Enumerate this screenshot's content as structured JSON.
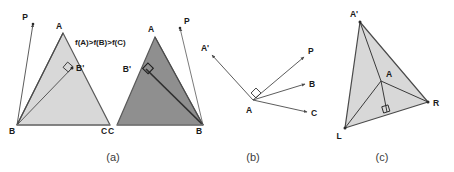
{
  "figure": {
    "width": 454,
    "height": 172,
    "background": "#ffffff",
    "stroke_color": "#4a4a4a",
    "label_color": "#1a1a1a",
    "caption_color": "#3b3b3b",
    "fill_light": "#d8d8d8",
    "fill_dark": "#8f8f8f"
  },
  "captions": [
    {
      "key": "a",
      "label": "(a)",
      "x": 113,
      "y": 160
    },
    {
      "key": "b",
      "label": "(b)",
      "x": 253,
      "y": 160
    },
    {
      "key": "c",
      "label": "(c)",
      "x": 382,
      "y": 160
    }
  ],
  "panel_a": {
    "annotation": "f(A)>f(B)>f(C)",
    "annotation_pos": {
      "x": 75,
      "y": 45
    },
    "triangle_light": {
      "fill": "#d8d8d8",
      "vertices": [
        {
          "name": "A",
          "x": 63,
          "y": 33,
          "label": "A",
          "label_x": 59,
          "label_y": 29
        },
        {
          "name": "B",
          "x": 17,
          "y": 125,
          "label": "B",
          "label_x": 12,
          "label_y": 134
        },
        {
          "name": "C",
          "x": 110,
          "y": 125,
          "label": "C",
          "label_x": 104,
          "label_y": 134
        }
      ],
      "point_P": {
        "name": "P",
        "x": 33,
        "y": 24,
        "label": "P",
        "label_x": 25,
        "label_y": 20
      },
      "point_Bprime": {
        "name": "B'",
        "x": 72,
        "y": 68,
        "label": "B'",
        "label_x": 76,
        "label_y": 70
      },
      "right_angle_marker": {
        "x": 68,
        "y": 67
      }
    },
    "triangle_dark": {
      "fill": "#8f8f8f",
      "vertices": [
        {
          "name": "A",
          "x": 155,
          "y": 37,
          "label": "A",
          "label_x": 151,
          "label_y": 32
        },
        {
          "name": "C",
          "x": 117,
          "y": 125,
          "label": "C",
          "label_x": 111,
          "label_y": 134
        },
        {
          "name": "B",
          "x": 203,
          "y": 125,
          "label": "B",
          "label_x": 199,
          "label_y": 134
        }
      ],
      "point_P": {
        "name": "P",
        "x": 180,
        "y": 28,
        "label": "P",
        "label_x": 183,
        "label_y": 24
      },
      "point_Bprime": {
        "name": "B'",
        "x": 146,
        "y": 69,
        "label": "B'",
        "label_x": 131,
        "label_y": 70
      },
      "right_angle_marker": {
        "x": 148,
        "y": 68
      }
    }
  },
  "panel_b": {
    "origin": {
      "name": "A",
      "x": 253,
      "y": 100,
      "label": "A",
      "label_x": 248,
      "label_y": 112
    },
    "right_angle_marker": {
      "x": 256,
      "y": 93
    },
    "rays": [
      {
        "name": "A'",
        "x": 212,
        "y": 55,
        "label": "A'",
        "label_x": 205,
        "label_y": 50
      },
      {
        "name": "P",
        "x": 304,
        "y": 57,
        "label": "P",
        "label_x": 307,
        "label_y": 53
      },
      {
        "name": "B",
        "x": 305,
        "y": 84,
        "label": "B",
        "label_x": 309,
        "label_y": 86
      },
      {
        "name": "C",
        "x": 307,
        "y": 112,
        "label": "C",
        "label_x": 311,
        "label_y": 115
      }
    ]
  },
  "panel_c": {
    "triangle": {
      "fill": "#d8d8d8",
      "vertices": [
        {
          "name": "A'",
          "x": 360,
          "y": 22,
          "label": "A'",
          "label_x": 354,
          "label_y": 16
        },
        {
          "name": "L",
          "x": 345,
          "y": 128,
          "label": "L",
          "label_x": 338,
          "label_y": 138
        },
        {
          "name": "R",
          "x": 428,
          "y": 102,
          "label": "R",
          "label_x": 433,
          "label_y": 106
        }
      ]
    },
    "interior_point": {
      "name": "A",
      "x": 381,
      "y": 81,
      "label": "A",
      "label_x": 385,
      "label_y": 76
    },
    "perpendicular_foot": {
      "x": 387,
      "y": 112
    },
    "right_angle_marker": {
      "x": 387,
      "y": 112
    }
  }
}
